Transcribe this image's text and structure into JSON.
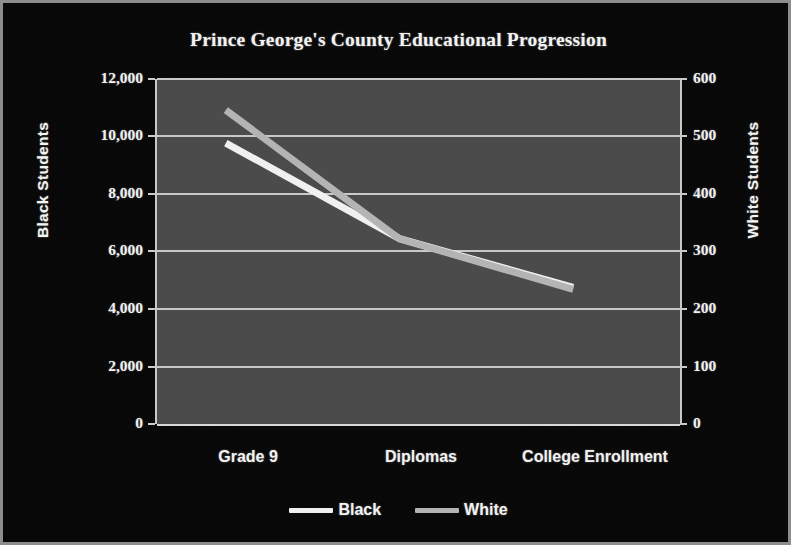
{
  "chart_data": {
    "type": "line",
    "title": "Prince George's County Educational Progression",
    "categories": [
      "Grade 9",
      "Diplomas",
      "College Enrollment"
    ],
    "series": [
      {
        "name": "Black",
        "axis": "left",
        "color": "#f0f0f0",
        "values": [
          9770,
          6450,
          4750
        ]
      },
      {
        "name": "White",
        "axis": "right",
        "color": "#b4b4b4",
        "values": [
          546,
          322,
          234
        ]
      }
    ],
    "axes": {
      "left": {
        "label": "Black Students",
        "ticks": [
          "0",
          "2,000",
          "4,000",
          "6,000",
          "8,000",
          "10,000",
          "12,000"
        ],
        "tick_values": [
          0,
          2000,
          4000,
          6000,
          8000,
          10000,
          12000
        ],
        "min": 0,
        "max": 12000
      },
      "right": {
        "label": "White Students",
        "ticks": [
          "0",
          "100",
          "200",
          "300",
          "400",
          "500",
          "600"
        ],
        "tick_values": [
          0,
          100,
          200,
          300,
          400,
          500,
          600
        ],
        "min": 0,
        "max": 600
      }
    },
    "xlabel": "",
    "grid": true,
    "legend_position": "bottom",
    "legend": [
      "Black",
      "White"
    ],
    "colors": {
      "figure_background": "#070707",
      "plot_background": "#4a4a4a",
      "gridline": "#c9c9c9",
      "text": "#f2f2f2",
      "border": "#8d8d8d"
    }
  }
}
